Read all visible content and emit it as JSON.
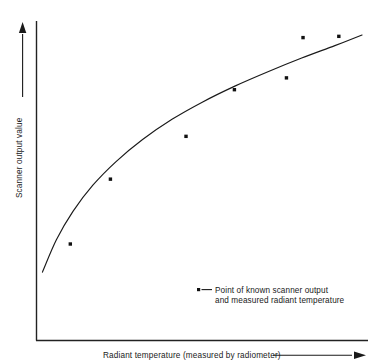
{
  "figure": {
    "background_color": "#ffffff",
    "ink_color": "#1a1a1a"
  },
  "axes": {
    "x_title": "Radiant temperature (measured by radiometer)",
    "y_title": "Scanner output value",
    "x_arrow_icon": "right-arrow-icon",
    "y_arrow_icon": "up-arrow-icon",
    "x_tick_labels": [],
    "y_tick_labels": [],
    "grid": false
  },
  "legend": {
    "marker_icon": "square-point-marker-icon",
    "line1": "Point of known scanner output",
    "line2": "and measured radiant temperature",
    "position": "inside-lower-right"
  },
  "chart_data": {
    "type": "scatter",
    "title": "",
    "subtitle": "",
    "xlabel": "Radiant temperature (measured by radiometer)",
    "ylabel": "Scanner output value",
    "xlim": [
      0,
      100
    ],
    "ylim": [
      0,
      100
    ],
    "grid": false,
    "legend_position": "inside-lower-right",
    "axis_ticks_shown": false,
    "series": [
      {
        "name": "Point of known scanner output and measured radiant temperature",
        "type": "scatter",
        "marker": "square",
        "color": "#111111",
        "x": [
          10.2,
          22.3,
          45.1,
          59.7,
          75.4,
          80.4,
          91.2
        ],
        "y": [
          30.2,
          50.5,
          63.9,
          78.5,
          82.2,
          94.8,
          95.2
        ]
      },
      {
        "name": "Fitted calibration curve",
        "type": "line",
        "color": "#1a1a1a",
        "x": [
          1.8,
          6.0,
          11.0,
          17.0,
          24.0,
          32.0,
          41.0,
          50.0,
          60.0,
          70.0,
          80.0,
          90.0,
          98.2
        ],
        "y": [
          21.4,
          31.5,
          40.4,
          48.6,
          56.0,
          62.9,
          69.3,
          74.6,
          79.7,
          84.2,
          88.4,
          92.3,
          95.6
        ]
      }
    ],
    "annotations": [
      {
        "text": "Point of known scanner output and measured radiant temperature",
        "x": 55,
        "y": 18
      }
    ]
  }
}
